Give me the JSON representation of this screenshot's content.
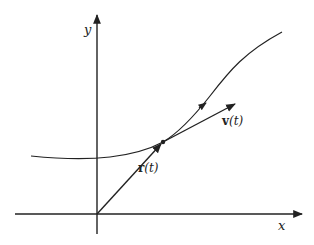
{
  "diagram": {
    "type": "vector-curve",
    "colors": {
      "ink": "#222222",
      "background": "#ffffff"
    },
    "axes": {
      "x_label": "x",
      "y_label": "y"
    },
    "vectors": [
      {
        "name": "r",
        "label_bold": "r",
        "label_rest": "(t)",
        "from": "origin",
        "to": "point-on-curve"
      },
      {
        "name": "v",
        "label_bold": "v",
        "label_rest": "(t)",
        "from": "point-on-curve",
        "direction": "tangent"
      }
    ],
    "curve": {
      "has_direction_arrow": true
    }
  }
}
